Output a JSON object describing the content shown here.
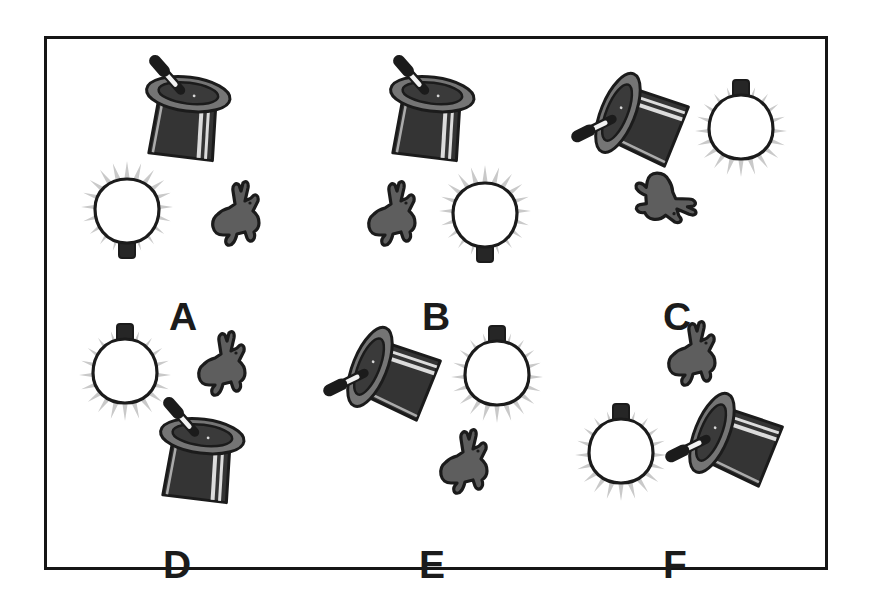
{
  "figure": {
    "background_color": "#ffffff",
    "frame": {
      "border_color": "#161616",
      "fill_color": "#ffffff",
      "x": 44,
      "y": 36,
      "width": 784,
      "height": 534
    },
    "palette": {
      "hat_body": "#3a3a3a",
      "hat_body_dark": "#2e2e2e",
      "hat_brim": "#6e6e6e",
      "hat_brim_hole": "#3a3a3a",
      "hat_stripe": "#d8d8d8",
      "wand_black": "#1b1b1b",
      "wand_white": "#f2f2f2",
      "bulb_glass": "#ffffff",
      "bulb_outline": "#1b1b1b",
      "bulb_base": "#262626",
      "bulb_rays": "#c9c9c9",
      "rabbit_fill": "#5e5e5e",
      "rabbit_outline": "#1b1b1b",
      "label_color": "#1b1b1b"
    },
    "object_names": [
      "top-hat-with-wand",
      "light-bulb",
      "rabbit"
    ],
    "panels": [
      {
        "id": "A",
        "label": "A",
        "label_x": 106,
        "label_y": 246,
        "objects": [
          {
            "kind": "hat",
            "x": 62,
            "y": 10,
            "rotation": 25,
            "name": "top-hat-with-wand"
          },
          {
            "kind": "bulb",
            "x": 16,
            "y": 108,
            "rotation": 180,
            "name": "light-bulb"
          },
          {
            "kind": "rabbit",
            "x": 140,
            "y": 126,
            "rotation": 0,
            "name": "rabbit"
          }
        ]
      },
      {
        "id": "B",
        "label": "B",
        "label_x": 101,
        "label_y": 246,
        "objects": [
          {
            "kind": "hat",
            "x": 48,
            "y": 10,
            "rotation": 25,
            "name": "top-hat-with-wand"
          },
          {
            "kind": "rabbit",
            "x": 38,
            "y": 126,
            "rotation": 0,
            "name": "rabbit"
          },
          {
            "kind": "bulb",
            "x": 116,
            "y": 112,
            "rotation": 180,
            "name": "light-bulb"
          }
        ]
      },
      {
        "id": "C",
        "label": "C",
        "label_x": 96,
        "label_y": 246,
        "objects": [
          {
            "kind": "hat",
            "x": 16,
            "y": 12,
            "rotation": -50,
            "name": "top-hat-with-wand"
          },
          {
            "kind": "bulb",
            "x": 126,
            "y": 24,
            "rotation": 0,
            "name": "light-bulb"
          },
          {
            "kind": "rabbit",
            "x": 68,
            "y": 108,
            "rotation": 100,
            "name": "rabbit"
          }
        ]
      },
      {
        "id": "D",
        "label": "D",
        "label_x": 100,
        "label_y": 238,
        "objects": [
          {
            "kind": "bulb",
            "x": 14,
            "y": 12,
            "rotation": 0,
            "name": "light-bulb"
          },
          {
            "kind": "rabbit",
            "x": 126,
            "y": 20,
            "rotation": 0,
            "name": "rabbit"
          },
          {
            "kind": "hat",
            "x": 76,
            "y": 96,
            "rotation": 25,
            "name": "top-hat-with-wand"
          }
        ]
      },
      {
        "id": "E",
        "label": "E",
        "label_x": 98,
        "label_y": 238,
        "objects": [
          {
            "kind": "hat",
            "x": 14,
            "y": 10,
            "rotation": -50,
            "name": "top-hat-with-wand"
          },
          {
            "kind": "bulb",
            "x": 128,
            "y": 14,
            "rotation": 0,
            "name": "light-bulb"
          },
          {
            "kind": "rabbit",
            "x": 110,
            "y": 118,
            "rotation": 0,
            "name": "rabbit"
          }
        ]
      },
      {
        "id": "F",
        "label": "F",
        "label_x": 96,
        "label_y": 238,
        "objects": [
          {
            "kind": "rabbit",
            "x": 92,
            "y": 10,
            "rotation": 0,
            "name": "rabbit"
          },
          {
            "kind": "bulb",
            "x": 6,
            "y": 92,
            "rotation": 0,
            "name": "light-bulb"
          },
          {
            "kind": "hat",
            "x": 110,
            "y": 76,
            "rotation": -50,
            "name": "top-hat-with-wand"
          }
        ]
      }
    ],
    "panel_positions": [
      {
        "id": "A",
        "x": 16,
        "y": 12
      },
      {
        "id": "B",
        "x": 274,
        "y": 12
      },
      {
        "id": "C",
        "x": 520,
        "y": 12
      },
      {
        "id": "D",
        "x": 16,
        "y": 268
      },
      {
        "id": "E",
        "x": 274,
        "y": 268
      },
      {
        "id": "F",
        "x": 520,
        "y": 268
      }
    ]
  }
}
